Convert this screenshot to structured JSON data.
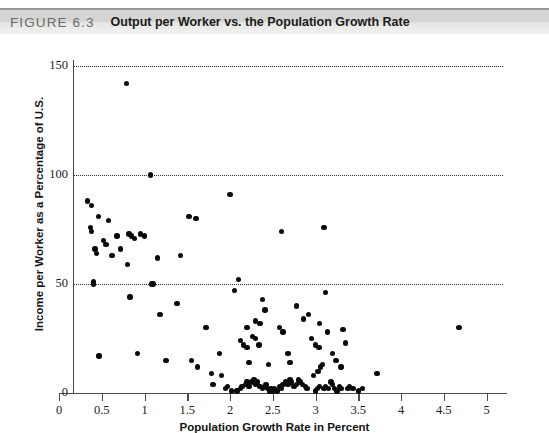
{
  "figure": {
    "number": "FIGURE 6.3",
    "title": "Output per Worker vs. the Population Growth Rate"
  },
  "chart_data": {
    "type": "scatter",
    "title": "Output per Worker vs. the Population Growth Rate",
    "xlabel": "Population Growth Rate in Percent",
    "ylabel": "Income per Worker as a Percentage of U.S.",
    "xlim": [
      0,
      5.2
    ],
    "ylim": [
      0,
      155
    ],
    "xticks": [
      0,
      0.5,
      1,
      1.5,
      2,
      2.5,
      3,
      3.5,
      4,
      4.5,
      5
    ],
    "xticklabels": [
      "0",
      "0.5",
      "1",
      "1.5",
      "2",
      "2.5",
      "3",
      "3.5",
      "4",
      "4.5",
      "5"
    ],
    "yticks": [
      0,
      50,
      100,
      150
    ],
    "yticklabels": [
      "0",
      "50",
      "100",
      "150"
    ],
    "gridlines_y": [
      50,
      100,
      150
    ],
    "grid": "horizontal-dotted",
    "legend": null,
    "marker": "filled-circle",
    "marker_color": "#0a0a0a",
    "points": [
      [
        0.33,
        88
      ],
      [
        0.38,
        86
      ],
      [
        0.4,
        50
      ],
      [
        0.4,
        51
      ],
      [
        0.37,
        76
      ],
      [
        0.38,
        74
      ],
      [
        0.42,
        66
      ],
      [
        0.44,
        64
      ],
      [
        0.46,
        81
      ],
      [
        0.52,
        70
      ],
      [
        0.55,
        68
      ],
      [
        0.47,
        17
      ],
      [
        0.58,
        79
      ],
      [
        0.62,
        63
      ],
      [
        0.79,
        142
      ],
      [
        0.68,
        72
      ],
      [
        0.72,
        66
      ],
      [
        0.82,
        73
      ],
      [
        0.85,
        72
      ],
      [
        0.88,
        71
      ],
      [
        0.8,
        59
      ],
      [
        0.83,
        44
      ],
      [
        0.95,
        73
      ],
      [
        1.0,
        72
      ],
      [
        1.07,
        100
      ],
      [
        1.08,
        50
      ],
      [
        1.1,
        50
      ],
      [
        1.15,
        62
      ],
      [
        1.18,
        36
      ],
      [
        0.92,
        18
      ],
      [
        1.25,
        15
      ],
      [
        1.42,
        63
      ],
      [
        1.38,
        41
      ],
      [
        1.52,
        81
      ],
      [
        1.6,
        80
      ],
      [
        1.55,
        15
      ],
      [
        1.62,
        12
      ],
      [
        1.72,
        30
      ],
      [
        1.78,
        9
      ],
      [
        1.8,
        4
      ],
      [
        1.88,
        18
      ],
      [
        1.9,
        8
      ],
      [
        1.95,
        2
      ],
      [
        1.97,
        3
      ],
      [
        2.02,
        1
      ],
      [
        2.05,
        47
      ],
      [
        2.08,
        1
      ],
      [
        2.0,
        91
      ],
      [
        2.1,
        52
      ],
      [
        2.12,
        2
      ],
      [
        2.14,
        3
      ],
      [
        2.18,
        4
      ],
      [
        2.2,
        5
      ],
      [
        2.22,
        3
      ],
      [
        2.25,
        5
      ],
      [
        2.28,
        6
      ],
      [
        2.3,
        4
      ],
      [
        2.32,
        5
      ],
      [
        2.35,
        3
      ],
      [
        2.26,
        26
      ],
      [
        2.3,
        25
      ],
      [
        2.34,
        22
      ],
      [
        2.12,
        24
      ],
      [
        2.16,
        22
      ],
      [
        2.2,
        21
      ],
      [
        2.38,
        2
      ],
      [
        2.4,
        3
      ],
      [
        2.42,
        4
      ],
      [
        2.44,
        2
      ],
      [
        2.46,
        1
      ],
      [
        2.48,
        2
      ],
      [
        2.5,
        1
      ],
      [
        2.38,
        43
      ],
      [
        2.41,
        38
      ],
      [
        2.3,
        33
      ],
      [
        2.35,
        32
      ],
      [
        2.2,
        30
      ],
      [
        2.22,
        14
      ],
      [
        2.45,
        13
      ],
      [
        2.52,
        2
      ],
      [
        2.55,
        1
      ],
      [
        2.58,
        3
      ],
      [
        2.6,
        2
      ],
      [
        2.62,
        4
      ],
      [
        2.65,
        5
      ],
      [
        2.68,
        4
      ],
      [
        2.7,
        6
      ],
      [
        2.72,
        5
      ],
      [
        2.6,
        74
      ],
      [
        2.58,
        30
      ],
      [
        2.62,
        28
      ],
      [
        2.68,
        18
      ],
      [
        2.7,
        14
      ],
      [
        2.75,
        3
      ],
      [
        2.78,
        4
      ],
      [
        2.8,
        6
      ],
      [
        2.82,
        5
      ],
      [
        2.85,
        4
      ],
      [
        2.88,
        3
      ],
      [
        2.9,
        2
      ],
      [
        2.92,
        36
      ],
      [
        2.86,
        34
      ],
      [
        2.78,
        40
      ],
      [
        2.95,
        25
      ],
      [
        2.98,
        8
      ],
      [
        3.0,
        1
      ],
      [
        3.02,
        2
      ],
      [
        3.05,
        3
      ],
      [
        3.03,
        10
      ],
      [
        3.06,
        12
      ],
      [
        3.08,
        13
      ],
      [
        3.0,
        22
      ],
      [
        3.04,
        21
      ],
      [
        3.1,
        2
      ],
      [
        3.12,
        3
      ],
      [
        3.15,
        2
      ],
      [
        3.1,
        76
      ],
      [
        3.12,
        46
      ],
      [
        3.05,
        32
      ],
      [
        3.14,
        28
      ],
      [
        3.18,
        5
      ],
      [
        3.2,
        4
      ],
      [
        3.22,
        2
      ],
      [
        3.25,
        1
      ],
      [
        3.28,
        3
      ],
      [
        3.3,
        2
      ],
      [
        3.2,
        18
      ],
      [
        3.24,
        15
      ],
      [
        3.32,
        29
      ],
      [
        3.35,
        23
      ],
      [
        3.3,
        12
      ],
      [
        3.38,
        2
      ],
      [
        3.4,
        3
      ],
      [
        3.44,
        2
      ],
      [
        3.5,
        1
      ],
      [
        3.55,
        2
      ],
      [
        3.72,
        9
      ],
      [
        4.68,
        30
      ]
    ]
  }
}
